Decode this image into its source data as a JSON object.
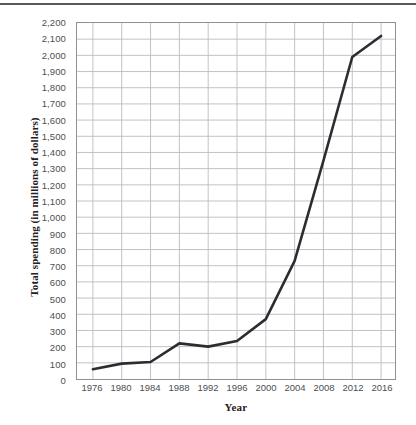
{
  "chart_data": {
    "type": "line",
    "title": "",
    "xlabel": "Year",
    "ylabel": "Total spending (in millions of dollars)",
    "x": [
      1976,
      1980,
      1984,
      1988,
      1992,
      1996,
      2000,
      2004,
      2008,
      2012,
      2016
    ],
    "values": [
      60,
      95,
      105,
      220,
      200,
      235,
      370,
      730,
      1350,
      1990,
      2120
    ],
    "series": [
      {
        "name": "Total spending",
        "values": [
          60,
          95,
          105,
          220,
          200,
          235,
          370,
          730,
          1350,
          1990,
          2120
        ]
      }
    ],
    "xlim": [
      1974,
      2018
    ],
    "ylim": [
      0,
      2200
    ],
    "ytick_step": 100,
    "y_tick_labels": [
      "0",
      "100",
      "200",
      "300",
      "400",
      "500",
      "600",
      "700",
      "800",
      "900",
      "1,000",
      "1,100",
      "1,200",
      "1,300",
      "1,400",
      "1,500",
      "1,600",
      "1,700",
      "1,800",
      "1,900",
      "2,000",
      "2,100",
      "2,200"
    ],
    "y_tick_values": [
      0,
      100,
      200,
      300,
      400,
      500,
      600,
      700,
      800,
      900,
      1000,
      1100,
      1200,
      1300,
      1400,
      1500,
      1600,
      1700,
      1800,
      1900,
      2000,
      2100,
      2200
    ],
    "x_tick_labels": [
      "1976",
      "1980",
      "1984",
      "1988",
      "1992",
      "1996",
      "2000",
      "2004",
      "2008",
      "2012",
      "2016"
    ],
    "grid": true,
    "legend": "none",
    "colors": {
      "line": "#2b2d30",
      "grid": "#b9bcc0",
      "frame": "#8e9195",
      "tick_text": "#4c4f53",
      "axis_title": "#1f2124",
      "top_rule": "#55585c",
      "background": "#ffffff"
    },
    "line_width": 2.6
  }
}
